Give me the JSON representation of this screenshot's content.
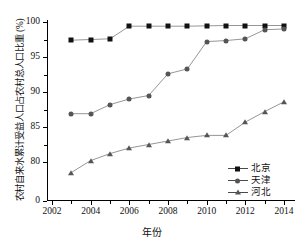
{
  "chart_data": {
    "type": "line",
    "title": "",
    "xlabel": "年份",
    "ylabel": "农村自来水累计受益人口占农村总人口比重 (%)",
    "x": [
      2003,
      2004,
      2005,
      2006,
      2007,
      2008,
      2009,
      2010,
      2011,
      2012,
      2013,
      2014
    ],
    "xlim": [
      2002,
      2015
    ],
    "ylim": [
      78,
      100.6
    ],
    "xticks": [
      "2002",
      "2004",
      "2006",
      "2008",
      "2010",
      "2012",
      "2014"
    ],
    "xtick_values": [
      2002,
      2004,
      2006,
      2008,
      2010,
      2012,
      2014
    ],
    "x_minor_ticks": [
      2003,
      2005,
      2007,
      2009,
      2011,
      2013
    ],
    "yticks": [
      "100",
      "95",
      "90",
      "85",
      "80",
      "0"
    ],
    "ytick_values": [
      100,
      95,
      90,
      85,
      80
    ],
    "y_minor_ticks": [
      97.5,
      92.5,
      87.5,
      82.5
    ],
    "y_axis_break": true,
    "y_break_label": "0",
    "grid": false,
    "legend_position": "bottom-right",
    "series": [
      {
        "name": "北京",
        "marker": "square",
        "color": "#111111",
        "values": [
          97.4,
          97.5,
          97.6,
          99.4,
          99.4,
          99.4,
          99.4,
          99.45,
          99.5,
          99.5,
          99.5,
          99.5
        ]
      },
      {
        "name": "天津",
        "marker": "circle",
        "color": "#555555",
        "values": [
          86.9,
          86.9,
          88.2,
          89.0,
          89.5,
          92.6,
          93.3,
          97.2,
          97.35,
          97.6,
          98.9,
          99.0
        ]
      },
      {
        "name": "河北",
        "marker": "triangle",
        "color": "#555555",
        "values": [
          78.5,
          80.2,
          81.2,
          82.0,
          82.5,
          83.0,
          83.5,
          83.8,
          83.8,
          85.7,
          87.2,
          88.6
        ]
      }
    ]
  },
  "legend": {
    "items": [
      {
        "label": "北京",
        "marker": "square"
      },
      {
        "label": "天津",
        "marker": "circle"
      },
      {
        "label": "河北",
        "marker": "triangle"
      }
    ]
  },
  "axes": {
    "x_title": "年份",
    "y_title": "农村自来水累计受益人口占农村总人口比重 (%)"
  }
}
